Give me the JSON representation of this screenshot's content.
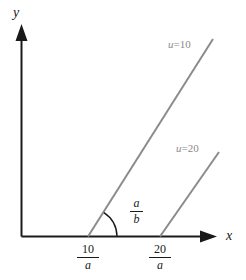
{
  "figure": {
    "axes": {
      "x_label": "x",
      "y_label": "y",
      "axis_color": "#1a1a1a"
    },
    "curves": [
      {
        "id": "u-10",
        "label_prefix": "u",
        "label_equals": "=",
        "label_value": "10",
        "color": "#8b8b8b"
      },
      {
        "id": "u-20",
        "label_prefix": "u",
        "label_equals": "=",
        "label_value": "20",
        "color": "#8b8b8b"
      }
    ],
    "x_ticks": [
      {
        "id": "tick-10-over-a",
        "numerator": "10",
        "denominator": "a"
      },
      {
        "id": "tick-20-over-a",
        "numerator": "20",
        "denominator": "a"
      }
    ],
    "angle": {
      "id": "angle-a-over-b",
      "numerator": "a",
      "denominator": "b"
    }
  }
}
